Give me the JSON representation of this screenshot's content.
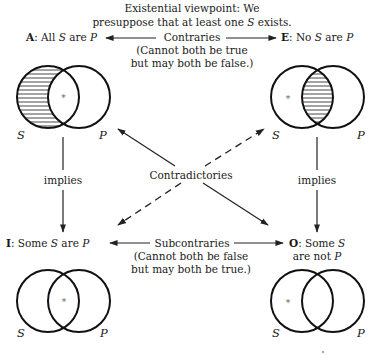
{
  "header": {
    "line1": "Existential viewpoint: We",
    "line2_pre": "presuppose that at least one ",
    "line2_var": "S",
    "line2_post": " exists."
  },
  "propositions": {
    "A": {
      "letter": "A",
      "pre": ": All ",
      "s": "S",
      "mid": " are ",
      "p": "P"
    },
    "E": {
      "letter": "E",
      "pre": ": No ",
      "s": "S",
      "mid": " are ",
      "p": "P"
    },
    "I": {
      "letter": "I",
      "pre": ": Some ",
      "s": "S",
      "mid": " are ",
      "p": "P"
    },
    "O": {
      "letter": "O",
      "pre": ": Some ",
      "s": "S",
      "line2_pre": "are not ",
      "p": "P"
    }
  },
  "relations": {
    "contraries": {
      "label": "Contraries",
      "note1": "(Cannot both be true",
      "note2": "but may both be false.)"
    },
    "subcontraries": {
      "label": "Subcontraries",
      "note1": "(Cannot both be false",
      "note2": "but may both be true.)"
    },
    "contradictories": {
      "label": "Contradictories"
    },
    "implies_left": {
      "label": "implies"
    },
    "implies_right": {
      "label": "implies"
    }
  },
  "venn": {
    "s_label": "S",
    "p_label": "P",
    "existence_mark": "*",
    "diagrams": [
      {
        "id": "A",
        "shaded": "S-only",
        "star": "S∩P"
      },
      {
        "id": "E",
        "shaded": "S∩P",
        "star": "S-only"
      },
      {
        "id": "I",
        "shaded": "none",
        "star": "S∩P"
      },
      {
        "id": "O",
        "shaded": "none",
        "star": "S-only"
      }
    ]
  },
  "colors": {
    "ink": "#111111",
    "background": "#ffffff"
  }
}
